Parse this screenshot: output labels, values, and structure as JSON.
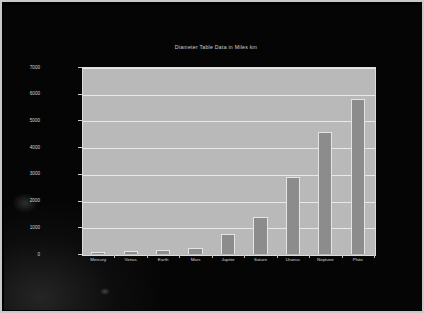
{
  "window": {
    "kind": "projected-slide-photo",
    "background_color": "#050505",
    "frame_color": "#c9c9c9"
  },
  "chart_data": {
    "type": "bar",
    "title": "Diameter Table Data in Miles km",
    "xlabel": "",
    "ylabel": "",
    "categories": [
      "Mercury",
      "Venus",
      "Earth",
      "Mars",
      "Jupiter",
      "Saturn",
      "Uranus",
      "Neptune",
      "Pluto"
    ],
    "values": [
      70,
      120,
      150,
      220,
      750,
      1400,
      2900,
      4550,
      5800
    ],
    "ylim": [
      0,
      7000
    ],
    "yticks": [
      0,
      1000,
      2000,
      3000,
      4000,
      5000,
      6000,
      7000
    ],
    "ytick_labels": [
      "0",
      "1000",
      "2000",
      "3000",
      "4000",
      "5000",
      "6000",
      "7000"
    ],
    "grid": true,
    "legend": false,
    "legend_position": "none",
    "bar_color": "#8c8c8c",
    "bar_edge_color": "#e4e4e4",
    "plot_background": "#b9b9b9",
    "gridline_color": "#e8e8e8",
    "text_color": "#d5d5d5"
  }
}
